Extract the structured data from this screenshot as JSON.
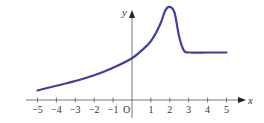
{
  "chart_data": {
    "type": "line",
    "title": "",
    "xlabel": "x",
    "ylabel": "y",
    "origin_label": "O",
    "xlim": [
      -5,
      5
    ],
    "ylim": [
      0,
      5
    ],
    "grid": false,
    "legend": null,
    "x_ticks": [
      -5,
      -4,
      -3,
      -2,
      -1,
      1,
      2,
      3,
      4,
      5
    ],
    "x_tick_labels": [
      "−5",
      "−4",
      "−3",
      "−2",
      "−1",
      "1",
      "2",
      "3",
      "4",
      "5"
    ],
    "series": [
      {
        "name": "f(x)",
        "color": "#3f3f9f",
        "x": [
          -5,
          -4,
          -3,
          -2,
          -1,
          0,
          0.5,
          1,
          1.5,
          1.75,
          2,
          2.25,
          2.5,
          2.75,
          3,
          4,
          5
        ],
        "values": [
          0.5,
          0.75,
          1.0,
          1.3,
          1.7,
          2.2,
          2.6,
          3.1,
          4.0,
          4.7,
          4.9,
          4.6,
          3.3,
          2.6,
          2.5,
          2.5,
          2.5
        ]
      }
    ]
  },
  "axes": {
    "x_label": "x",
    "y_label": "y",
    "origin": "O"
  }
}
